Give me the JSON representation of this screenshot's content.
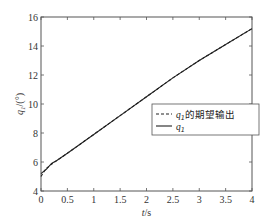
{
  "chart_data": {
    "type": "line",
    "title": "",
    "xlabel": "t/s",
    "ylabel": "q1/(°)",
    "xlim": [
      0,
      4
    ],
    "ylim": [
      4,
      16
    ],
    "xticks": [
      "0",
      "0.5",
      "1",
      "1.5",
      "2",
      "2.5",
      "3",
      "3.5",
      "4"
    ],
    "yticks": [
      "4",
      "6",
      "8",
      "10",
      "12",
      "14",
      "16"
    ],
    "grid": false,
    "legend_position": "center-right",
    "series": [
      {
        "name": "q1的期望输出",
        "style": "dashed",
        "x": [
          0,
          0.05,
          0.1,
          0.2,
          0.3,
          0.5,
          1,
          1.5,
          2,
          2.5,
          3,
          3.5,
          4
        ],
        "y": [
          5.0,
          5.3,
          5.55,
          5.85,
          6.1,
          6.6,
          7.9,
          9.2,
          10.5,
          11.8,
          13.0,
          14.1,
          15.2
        ]
      },
      {
        "name": "q1",
        "style": "solid",
        "x": [
          0,
          0.05,
          0.1,
          0.2,
          0.3,
          0.5,
          1,
          1.5,
          2,
          2.5,
          3,
          3.5,
          4
        ],
        "y": [
          5.2,
          5.35,
          5.5,
          5.9,
          6.1,
          6.6,
          7.9,
          9.2,
          10.5,
          11.8,
          13.0,
          14.1,
          15.2
        ]
      }
    ]
  },
  "legend": {
    "items": [
      {
        "symbol": "q",
        "sub": "1",
        "suffix": "的期望输出"
      },
      {
        "symbol": "q",
        "sub": "1",
        "suffix": ""
      }
    ]
  },
  "axes": {
    "xlabel_t": "t",
    "xlabel_unit": "/s",
    "ylabel_q": "q",
    "ylabel_sub": "1",
    "ylabel_unit": "/(°)"
  }
}
